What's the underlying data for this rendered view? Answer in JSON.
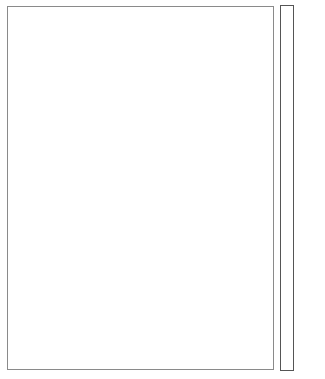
{
  "chart_data": {
    "type": "heatmap",
    "title": "",
    "xlabel": "",
    "ylabel": "",
    "legend": {
      "type": "colorbar",
      "position": "right",
      "range": [
        9,
        33
      ],
      "breaks": [
        9,
        11.7,
        14.3,
        17,
        19.7,
        22.3,
        25,
        27.7,
        30.3,
        33
      ],
      "ticks": [
        10,
        15,
        20,
        25,
        30
      ],
      "tick_labels": [
        "10",
        "15",
        "20",
        "25",
        "30"
      ],
      "colors": [
        "#a83c3a",
        "#df5d3f",
        "#f8a05b",
        "#f0d088",
        "#f5f5b0",
        "#bfe09a",
        "#8ec79a",
        "#4f9d8a",
        "#2f5f9e"
      ]
    },
    "classes_present": [
      {
        "name": "low",
        "approx_value": 10,
        "color": "#a83c3a"
      },
      {
        "name": "mid",
        "approx_value": 22,
        "color": "#f5f5b0"
      },
      {
        "name": "high-mid",
        "approx_value": 29,
        "color": "#4f9d8a"
      },
      {
        "name": "high",
        "approx_value": 32,
        "color": "#2f5f9e"
      }
    ],
    "grid": false
  },
  "map": {
    "cell": 4,
    "regions": [
      {
        "class": "mid",
        "color": "#f5f5b0",
        "points": "243,8 250,20 258,34 264,48 266,62 262,76 258,90 252,104 248,116 244,128 240,140 236,154 232,168 228,184 222,200 216,214 208,228 200,240 196,252 192,266 194,280 204,292 212,306 214,318 206,322 194,316 180,306 166,300 152,310 140,326 122,344 104,356 86,362 62,366 40,366 22,360 12,344 10,326 14,304 24,284 38,264 52,244 64,226 76,206 90,186 104,168 118,150 132,134 148,118 162,102 176,86 188,70 200,54 212,40 224,26 234,14"
      },
      {
        "class": "low",
        "color": "#a83c3a",
        "points": "243,8 250,20 256,32 262,44 260,54 252,58 246,64 240,72 232,80 226,86 218,82 212,74 206,70 200,72 196,80 194,90 190,98 184,108 176,118 168,124 160,130 150,140 140,148 130,156 120,164 112,176 104,188 100,198 96,192 100,178 108,164 118,150 132,134 148,118 162,102 176,86 188,70 200,54 212,40 224,26 234,14"
      },
      {
        "class": "low",
        "color": "#a83c3a",
        "points": "62,226 72,240 84,256 94,270 98,282 90,290 76,296 64,292 56,282 48,270 40,262 46,250 54,238"
      },
      {
        "class": "low",
        "color": "#a83c3a",
        "points": "14,320 22,332 34,342 46,350 56,358 66,366 50,366 36,364 24,360 14,350 10,336"
      },
      {
        "class": "low",
        "color": "#a83c3a",
        "points": "170,300 176,298 180,306 184,312 178,314 172,308 164,310 160,306"
      },
      {
        "class": "low",
        "color": "#a83c3a",
        "points": "160,170 168,176 172,186 170,196 164,204 160,198 162,186 158,178"
      },
      {
        "class": "high",
        "color": "#2f5f9e",
        "points": "250,62 258,70 262,80 258,92 252,104 248,116 244,128 240,140 236,154 232,168 228,184 222,200 216,212 208,222 200,236 194,246 186,256 176,264 170,254 174,240 180,226 186,214 194,202 196,190 190,180 184,172 190,160 198,148 204,136 210,124 214,110 218,98 224,88 232,80 240,72"
      },
      {
        "class": "high",
        "color": "#2f5f9e",
        "points": "124,176 132,178 138,186 146,184 152,176 160,172 158,184 158,198 162,212 164,226 170,238 168,252 160,262 150,266 140,262 134,254 130,242 128,228 124,214 122,200 120,188"
      },
      {
        "class": "high",
        "color": "#2f5f9e",
        "points": "192,306 200,306 204,314 206,324 200,326 194,320 190,312"
      },
      {
        "class": "high",
        "color": "#2f5f9e",
        "points": "180,250 186,246 188,256 182,262 176,260"
      },
      {
        "class": "high-mid",
        "color": "#4f9d8a",
        "points": "218,80 228,80 232,86 226,90 218,88"
      },
      {
        "class": "high-mid",
        "color": "#4f9d8a",
        "points": "124,168 132,166 136,176 132,182 124,186 120,180"
      },
      {
        "class": "high-mid",
        "color": "#4f9d8a",
        "points": "104,266 120,262 132,266 136,278 132,290 120,296 108,292 100,282"
      },
      {
        "class": "high-mid",
        "color": "#4f9d8a",
        "points": "50,282 60,276 72,282 82,290 90,298 98,308 110,318 114,330 104,340 90,346 74,352 62,354 52,348 46,336 44,320 44,304 46,292"
      }
    ]
  }
}
